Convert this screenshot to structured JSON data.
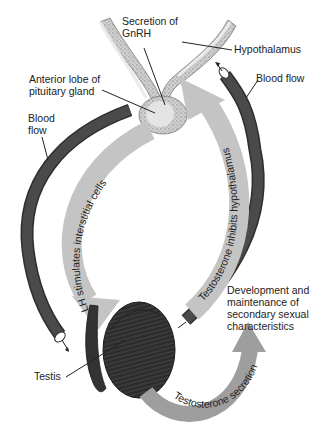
{
  "diagram": {
    "type": "hormonal-feedback-loop",
    "labels": {
      "gnrh_line1": "Secretion of",
      "gnrh_line2": "GnRH",
      "hypothalamus": "Hypothalamus",
      "pituitary_line1": "Anterior lobe of",
      "pituitary_line2": "pituitary gland",
      "blood_flow_left_line1": "Blood",
      "blood_flow_left_line2": "flow",
      "blood_flow_right": "Blood flow",
      "testis": "Testis",
      "development_line1": "Development and",
      "development_line2": "maintenance of",
      "development_line3": "secondary sexual",
      "development_line4": "characteristics"
    },
    "arrows": {
      "lh": "LH stimulates interstitial cells",
      "inhibits": "Testosterone inhibits hypothalamus",
      "secretion": "Testosterone secretion"
    },
    "colors": {
      "vessel": "#4a4a4a",
      "vessel_edge": "#2e2e2e",
      "grey_arrow": "#c4c4c4",
      "secretion_arrow": "#9e9e9e",
      "testis": "#333333",
      "pituitary": "#d9d9d9",
      "hypothalamus_stipple": "#b5b5b5",
      "background": "#ffffff"
    }
  }
}
